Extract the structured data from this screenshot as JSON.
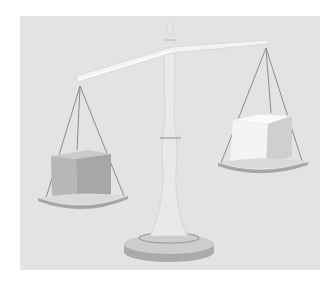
{
  "image": {
    "subject": "balance scale",
    "description": "Illustration of a balance scale tipped to the left, with a darker gray cube on the lower left pan and a lighter white cube on the raised right pan",
    "left_pan": {
      "object": "cube",
      "shade": "dark gray",
      "position": "lower"
    },
    "right_pan": {
      "object": "cube",
      "shade": "light/white",
      "position": "higher"
    }
  },
  "colors": {
    "background": "#e3e3e3",
    "page": "#ffffff",
    "strings": "#8a8a8a",
    "pan": "#a9a9a9",
    "beam": "#f2f2f2",
    "left_cube_front": "#b4b4b4",
    "left_cube_top": "#cbcbcb",
    "left_cube_side": "#a6a6a6",
    "right_cube_front": "#f3f3f3",
    "right_cube_top": "#fafafa",
    "right_cube_side": "#cfcfcf",
    "base": "#b0b0b0"
  }
}
